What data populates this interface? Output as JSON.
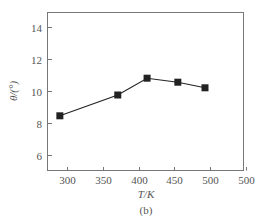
{
  "chart_data": {
    "type": "line",
    "title": "",
    "caption": "(b)",
    "xlabel": "T/K",
    "ylabel": "θ/(°)",
    "x": [
      290,
      371,
      412,
      455,
      493
    ],
    "series": [
      {
        "name": "θ",
        "values": [
          8.45,
          9.75,
          10.8,
          10.55,
          10.2
        ],
        "marker": "square",
        "color": "#222222"
      }
    ],
    "xlim": [
      272,
      550
    ],
    "ylim": [
      5.1,
      14.9
    ],
    "xticks": [
      300,
      350,
      400,
      450,
      500,
      550
    ],
    "xtick_labels": [
      "300",
      "350",
      "400",
      "450",
      "500",
      "500"
    ],
    "yticks": [
      6,
      8,
      10,
      12,
      14
    ],
    "ytick_labels": [
      "6",
      "8",
      "10",
      "12",
      "14"
    ],
    "grid": false,
    "legend": null,
    "frame": "full box"
  }
}
